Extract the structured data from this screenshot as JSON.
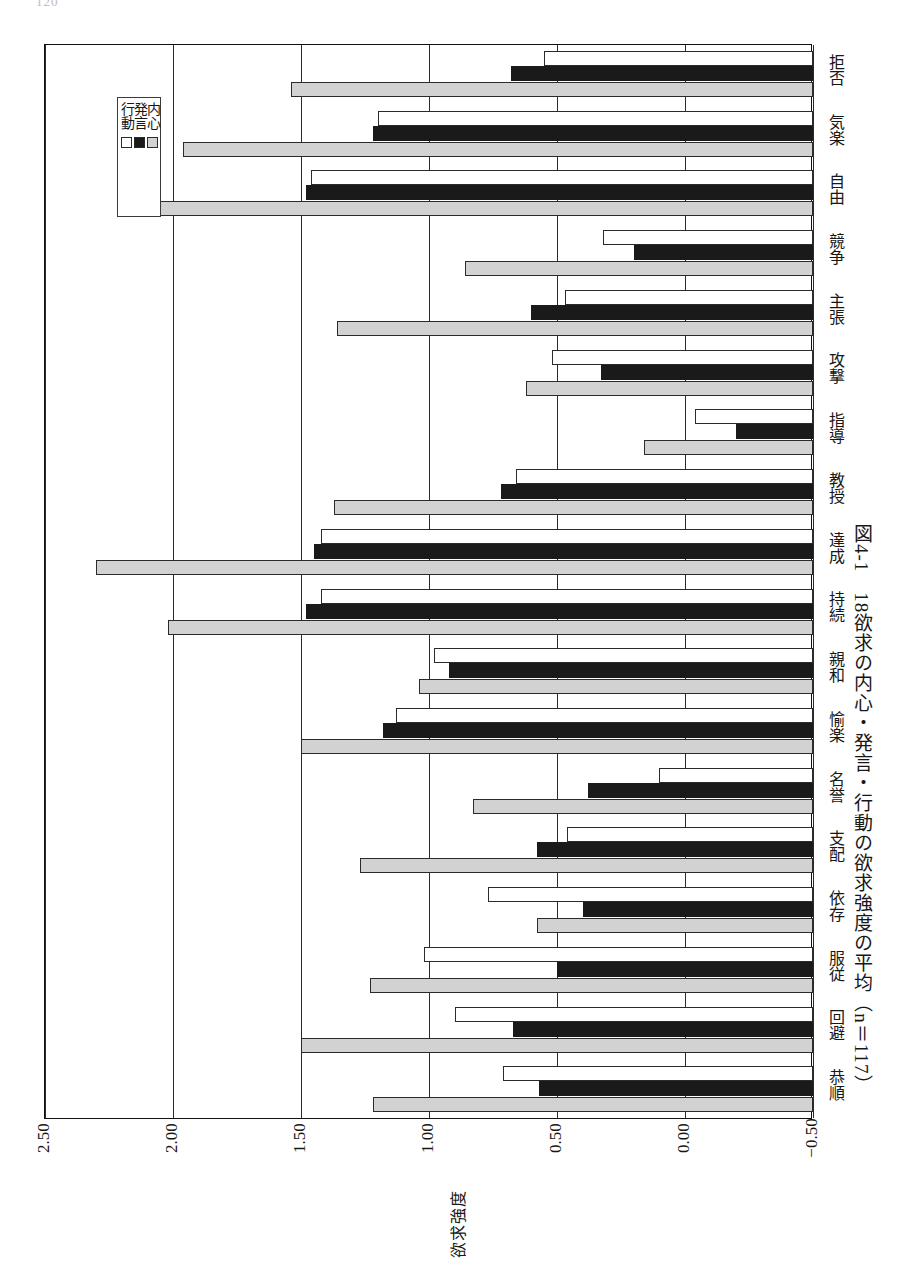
{
  "page_number": "120",
  "caption": "図4-1　18欲求の内心・発言・行動の欲求強度の平均（n＝117）",
  "legend": {
    "position": "top-left-inside",
    "items": [
      {
        "key": "inner",
        "label": "内心",
        "color": "#d2d2d2"
      },
      {
        "key": "speech",
        "label": "発言",
        "color": "#1a1a1a"
      },
      {
        "key": "action",
        "label": "行動",
        "color": "#ffffff"
      }
    ]
  },
  "axis": {
    "value_title": "欲求強度",
    "tick_labels": [
      "2.50",
      "2.00",
      "1.50",
      "1.00",
      "0.50",
      "0.00",
      "−0.50"
    ],
    "tick_values": [
      2.5,
      2.0,
      1.5,
      1.0,
      0.5,
      0.0,
      -0.5
    ]
  },
  "chart_data": {
    "type": "bar",
    "orientation": "horizontal-rotated",
    "title": "図4-1　18欲求の内心・発言・行動の欲求強度の平均（n＝117）",
    "xlabel": "",
    "ylabel": "欲求強度",
    "ylim": [
      -0.5,
      2.5
    ],
    "grid": true,
    "legend_position": "top-left-inside",
    "n": 117,
    "categories": [
      "拒否",
      "気楽",
      "自由",
      "競争",
      "主張",
      "攻撃",
      "指導",
      "教授",
      "達成",
      "持続",
      "親和",
      "愉楽",
      "名誉",
      "支配",
      "依存",
      "服従",
      "回避",
      "恭順"
    ],
    "series": [
      {
        "name": "内心",
        "color": "#d2d2d2",
        "values": [
          1.54,
          1.96,
          2.05,
          0.86,
          1.36,
          0.62,
          0.16,
          1.37,
          2.3,
          2.02,
          1.04,
          1.5,
          0.83,
          1.27,
          0.58,
          1.23,
          1.5,
          1.22
        ]
      },
      {
        "name": "発言",
        "color": "#1a1a1a",
        "values": [
          0.68,
          1.22,
          1.48,
          0.2,
          0.6,
          0.33,
          -0.2,
          0.72,
          1.45,
          1.48,
          0.92,
          1.18,
          0.38,
          0.58,
          0.4,
          0.5,
          0.67,
          0.57
        ]
      },
      {
        "name": "行動",
        "color": "#ffffff",
        "values": [
          0.55,
          1.2,
          1.46,
          0.32,
          0.47,
          0.52,
          -0.04,
          0.66,
          1.42,
          1.42,
          0.98,
          1.13,
          0.1,
          0.46,
          0.77,
          1.02,
          0.9,
          0.71
        ]
      }
    ]
  }
}
